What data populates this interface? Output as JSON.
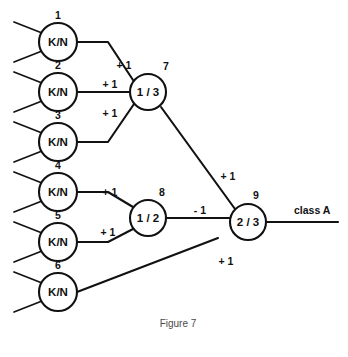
{
  "figure": {
    "caption": "Figure 7",
    "top_cut_text": "",
    "output_label": "class A"
  },
  "nodes": [
    {
      "id": "1",
      "index": "1",
      "label": "K/N",
      "cx": 58,
      "cy": 42,
      "r": 19,
      "index_dx": 0,
      "index_dy": -23
    },
    {
      "id": "2",
      "index": "2",
      "label": "K/N",
      "cx": 58,
      "cy": 92,
      "r": 19,
      "index_dx": 0,
      "index_dy": -23
    },
    {
      "id": "3",
      "index": "3",
      "label": "K/N",
      "cx": 58,
      "cy": 142,
      "r": 19,
      "index_dx": 0,
      "index_dy": -23
    },
    {
      "id": "4",
      "index": "4",
      "label": "K/N",
      "cx": 58,
      "cy": 192,
      "r": 19,
      "index_dx": 0,
      "index_dy": -23
    },
    {
      "id": "5",
      "index": "5",
      "label": "K/N",
      "cx": 58,
      "cy": 242,
      "r": 19,
      "index_dx": 0,
      "index_dy": -23
    },
    {
      "id": "6",
      "index": "6",
      "label": "K/N",
      "cx": 58,
      "cy": 292,
      "r": 19,
      "index_dx": 0,
      "index_dy": -23
    },
    {
      "id": "7",
      "index": "7",
      "label": "1 / 3",
      "cx": 148,
      "cy": 92,
      "r": 18,
      "index_dx": 18,
      "index_dy": -22
    },
    {
      "id": "8",
      "index": "8",
      "label": "1 / 2",
      "cx": 148,
      "cy": 218,
      "r": 18,
      "index_dx": 14,
      "index_dy": -22
    },
    {
      "id": "9",
      "index": "9",
      "label": "2 / 3",
      "cx": 248,
      "cy": 222,
      "r": 18,
      "index_dx": 8,
      "index_dy": -23
    }
  ],
  "input_stubs": [
    {
      "node": "1",
      "x1": 14,
      "y1": 22,
      "x2": 42,
      "y2": 33
    },
    {
      "node": "1",
      "x1": 14,
      "y1": 62,
      "x2": 42,
      "y2": 51
    },
    {
      "node": "2",
      "x1": 14,
      "y1": 72,
      "x2": 42,
      "y2": 83
    },
    {
      "node": "2",
      "x1": 14,
      "y1": 112,
      "x2": 42,
      "y2": 101
    },
    {
      "node": "3",
      "x1": 14,
      "y1": 122,
      "x2": 42,
      "y2": 133
    },
    {
      "node": "3",
      "x1": 14,
      "y1": 162,
      "x2": 42,
      "y2": 151
    },
    {
      "node": "4",
      "x1": 14,
      "y1": 172,
      "x2": 42,
      "y2": 183
    },
    {
      "node": "4",
      "x1": 14,
      "y1": 212,
      "x2": 42,
      "y2": 201
    },
    {
      "node": "5",
      "x1": 14,
      "y1": 222,
      "x2": 42,
      "y2": 233
    },
    {
      "node": "5",
      "x1": 14,
      "y1": 262,
      "x2": 42,
      "y2": 251
    },
    {
      "node": "6",
      "x1": 14,
      "y1": 272,
      "x2": 42,
      "y2": 283
    },
    {
      "node": "6",
      "x1": 14,
      "y1": 312,
      "x2": 42,
      "y2": 301
    }
  ],
  "edges": [
    {
      "id": "e1-7",
      "from": "1",
      "to": "7",
      "weight": "+ 1",
      "points": "77,42 108,42 133,80",
      "label_x": 124,
      "label_y": 69
    },
    {
      "id": "e2-7",
      "from": "2",
      "to": "7",
      "weight": "+ 1",
      "points": "77,92 130,92",
      "label_x": 110,
      "label_y": 88
    },
    {
      "id": "e3-7",
      "from": "3",
      "to": "7",
      "weight": "+ 1",
      "points": "77,142 108,142 134,104",
      "label_x": 110,
      "label_y": 117
    },
    {
      "id": "e4-8",
      "from": "4",
      "to": "8",
      "weight": "+ 1",
      "points": "77,192 108,192 133,207",
      "label_x": 110,
      "label_y": 196
    },
    {
      "id": "e5-8",
      "from": "5",
      "to": "8",
      "weight": "+ 1",
      "points": "77,242 108,242 133,229",
      "label_x": 108,
      "label_y": 236
    },
    {
      "id": "e6-9",
      "from": "6",
      "to": "9",
      "weight": "+ 1",
      "points": "77,292 218,238",
      "label_x": 226,
      "label_y": 265
    },
    {
      "id": "e7-9",
      "from": "7",
      "to": "9",
      "weight": "+ 1",
      "points": "161,107 235,209",
      "label_x": 228,
      "label_y": 180
    },
    {
      "id": "e8-9",
      "from": "8",
      "to": "9",
      "weight": "- 1",
      "points": "166,218 230,218",
      "label_x": 200,
      "label_y": 214
    }
  ],
  "output_edge": {
    "id": "e9-out",
    "from": "9",
    "points": "266,222 338,222",
    "label": "class A",
    "label_x": 294,
    "label_y": 214
  },
  "caption": {
    "text": "Figure 7",
    "x": 178,
    "y": 327
  },
  "colors": {
    "stroke": "#111111",
    "background": "#ffffff",
    "caption": "#4a4a4a"
  }
}
